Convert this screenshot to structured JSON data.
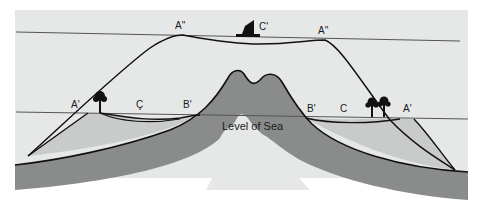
{
  "diagram": {
    "type": "cross-section",
    "labels": {
      "sea_level": "Level of Sea",
      "upper_left_A2": "A''",
      "upper_right_A2": "A''",
      "upper_center_C2": "C'",
      "lower_left_A1": "A'",
      "lower_left_C": "Ç",
      "lower_left_B1": "B'",
      "lower_right_B1": "B'",
      "lower_right_C": "C",
      "lower_right_A1": "A'"
    },
    "icons": {
      "boat": "sailboat-icon",
      "tree_left": "palm-tree-icon",
      "trees_right": "palm-trees-icon"
    },
    "colors": {
      "background": "#ffffff",
      "panel": "#e6e8e8",
      "reef": "#c9cbcb",
      "crust": "#8a8c8c",
      "line": "#111111",
      "sea_line": "#555555"
    }
  }
}
